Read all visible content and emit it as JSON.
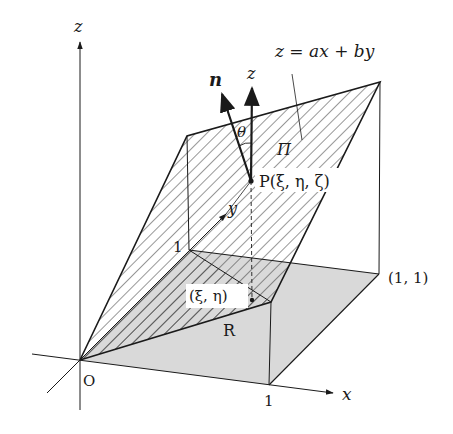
{
  "figure": {
    "type": "3d-surface-projection-diagram",
    "colors": {
      "ink": "#1a1a1a",
      "region_fill": "#d9d9d9",
      "background": "#ffffff"
    },
    "axes": {
      "x_label": "x",
      "y_label": "y",
      "z_label": "z",
      "origin_label": "O"
    },
    "ticks": {
      "x_one": "1",
      "y_one": "1"
    },
    "plane": {
      "equation": "z = ax + by",
      "name": "Π"
    },
    "region": {
      "name": "R",
      "corner_label": "(1, 1)"
    },
    "point": {
      "surface_label": "P(ξ, η, ζ)",
      "projection_label": "(ξ, η)"
    },
    "vectors": {
      "normal_label": "n",
      "vertical_label": "z",
      "angle_label": "θ"
    }
  }
}
